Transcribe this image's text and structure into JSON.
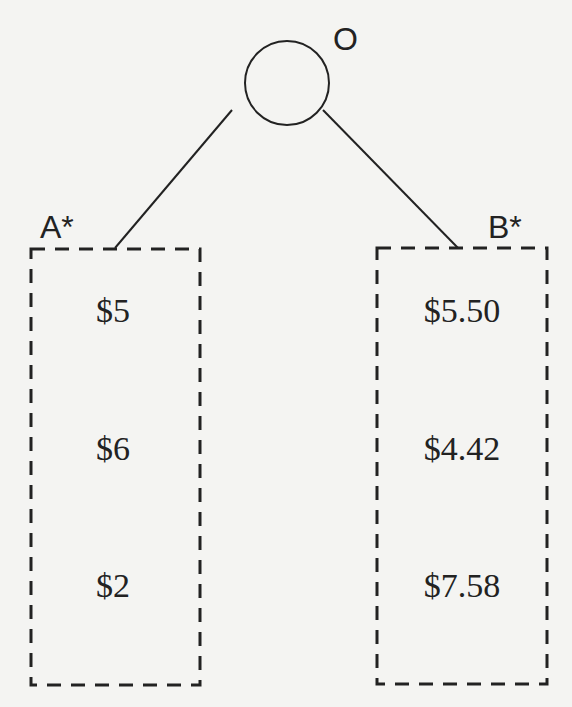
{
  "diagram": {
    "root": {
      "label": "O",
      "type": "chance-node-circle"
    },
    "branches": [
      {
        "label": "A*",
        "outcomes": [
          "$5",
          "$6",
          "$2"
        ]
      },
      {
        "label": "B*",
        "outcomes": [
          "$5.50",
          "$4.42",
          "$7.58"
        ]
      }
    ],
    "colors": {
      "background": "#f4f4f2",
      "ink": "#222222"
    }
  }
}
